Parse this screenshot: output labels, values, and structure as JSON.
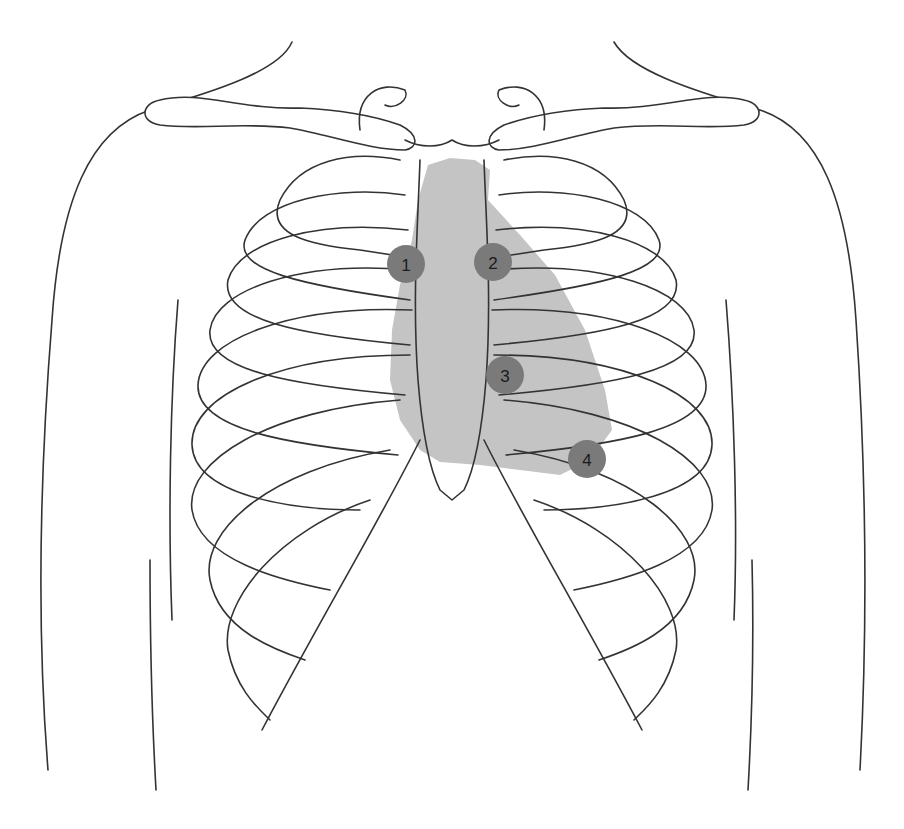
{
  "diagram": {
    "heart_region_color": "#c4c4c4",
    "marker_color": "#7a7a7a",
    "line_color": "#333333",
    "markers": [
      {
        "label": "1",
        "x": 406,
        "y": 264
      },
      {
        "label": "2",
        "x": 493,
        "y": 262
      },
      {
        "label": "3",
        "x": 505,
        "y": 375
      },
      {
        "label": "4",
        "x": 587,
        "y": 459
      }
    ]
  }
}
